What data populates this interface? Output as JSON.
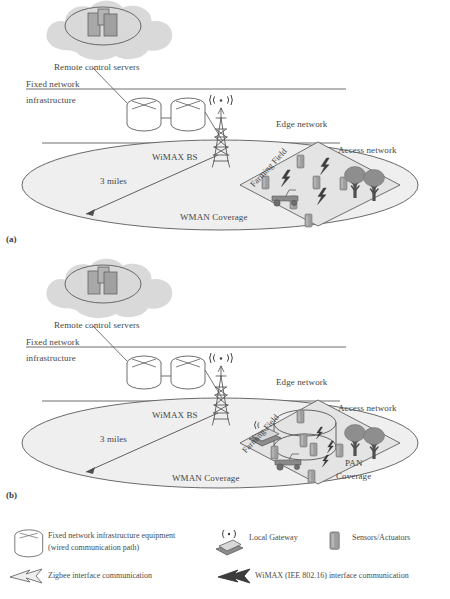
{
  "figure": {
    "panels": [
      {
        "tag": "(a)",
        "name": "panel-a",
        "cloud_label": "Remote control servers",
        "fixed_network_line1": "Fixed network",
        "fixed_network_line2": "infrastructure",
        "edge_network_label": "Edge network",
        "access_network_label": "Access network",
        "bs_label": "WiMAX BS",
        "distance_label": "3 miles",
        "coverage_label": "WMAN Coverage",
        "field_label": "Farming Field",
        "pan_label": "",
        "pan_coverage_label": "",
        "has_pan": false,
        "sensor_count": 6,
        "bolt_count": 3,
        "tree_count": 2
      },
      {
        "tag": "(b)",
        "name": "panel-b",
        "cloud_label": "Remote control servers",
        "fixed_network_line1": "Fixed network",
        "fixed_network_line2": "infrastructure",
        "edge_network_label": "Edge network",
        "access_network_label": "Access network",
        "bs_label": "WiMAX BS",
        "distance_label": "3 miles",
        "coverage_label": "WMAN Coverage",
        "field_label": "Farming Field",
        "pan_label": "PAN",
        "pan_coverage_label": "Coverage",
        "has_pan": true,
        "sensor_count": 6,
        "bolt_count": 3,
        "tree_count": 2
      }
    ]
  },
  "legend": {
    "items": [
      {
        "icon": "cylinder-router-icon",
        "label_line1": "Fixed network infrastructure equipment",
        "label_line2": "(wired communication path)"
      },
      {
        "icon": "local-gateway-icon",
        "label_line1": "Local Gateway",
        "label_line2": ""
      },
      {
        "icon": "sensor-actuator-icon",
        "label_line1": "Sensors/Actuators",
        "label_line2": ""
      },
      {
        "icon": "zigbee-arrow-icon",
        "label_line1": "Zigbee interface communication",
        "label_line2": ""
      },
      {
        "icon": "wimax-bolt-icon",
        "label_line1": "WiMAX (IEE 802.16) interface communication",
        "label_line2": ""
      }
    ]
  },
  "colors": {
    "ink": "#4a4a4a",
    "line": "#5d5d5d",
    "cloud_fill": "#d8d8d8",
    "server_fill": "#a9a9a9",
    "ellipse_fill": "#ededed",
    "field_fill": "#e2e2e2",
    "sensor_fill": "#9c9c9c",
    "tree_fill": "#8f8f8f",
    "bolt_fill": "#3a3a3a",
    "paper": "#ffffff"
  }
}
